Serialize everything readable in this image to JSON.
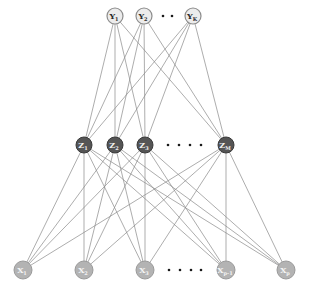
{
  "diagram": {
    "type": "neural-network",
    "colors": {
      "edge": "#8a8a8a",
      "output_fill": "#ececec",
      "hidden_fill": "#555555",
      "input_fill": "#b3b3b3"
    },
    "layers": {
      "output": {
        "y": 16,
        "radius": 8,
        "nodes": [
          {
            "id": "Y1",
            "main": "Y",
            "sub": "1",
            "x": 115
          },
          {
            "id": "Y2",
            "main": "Y",
            "sub": "2",
            "x": 144
          },
          {
            "id": "YK",
            "main": "Y",
            "sub": "K",
            "x": 193
          }
        ],
        "ellipsis": {
          "count": 2,
          "xs": [
            163,
            172
          ],
          "y": 16
        }
      },
      "hidden": {
        "y": 145,
        "radius": 8,
        "nodes": [
          {
            "id": "Z1",
            "main": "Z",
            "sub": "1",
            "x": 84
          },
          {
            "id": "Z2",
            "main": "Z",
            "sub": "2",
            "x": 115
          },
          {
            "id": "Z3",
            "main": "Z",
            "sub": "3",
            "x": 145
          },
          {
            "id": "ZM",
            "main": "Z",
            "sub": "M",
            "x": 226
          }
        ],
        "ellipsis": {
          "count": 4,
          "xs": [
            168,
            179,
            190,
            201
          ],
          "y": 145
        }
      },
      "input": {
        "y": 270,
        "radius": 9,
        "nodes": [
          {
            "id": "X1",
            "main": "X",
            "sub": "1",
            "x": 23
          },
          {
            "id": "X2",
            "main": "X",
            "sub": "2",
            "x": 84
          },
          {
            "id": "X3",
            "main": "X",
            "sub": "3",
            "x": 145
          },
          {
            "id": "XP-1",
            "main": "X",
            "sub": "p-1",
            "x": 226
          },
          {
            "id": "XP",
            "main": "X",
            "sub": "p",
            "x": 286
          }
        ],
        "ellipsis": {
          "count": 4,
          "xs": [
            169,
            180,
            191,
            201
          ],
          "y": 270
        }
      }
    },
    "connections": [
      {
        "from": "hidden",
        "to": "output",
        "pattern": "fully-connected"
      },
      {
        "from": "input",
        "to": "hidden",
        "pattern": "fully-connected"
      }
    ]
  }
}
